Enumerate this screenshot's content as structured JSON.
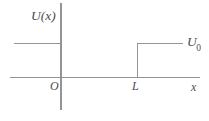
{
  "figure": {
    "background_color": "#ffffff",
    "line_color": "#949494",
    "text_color": "#4d4d4d"
  },
  "axes": {
    "vertical_label": "U(x)",
    "horizontal_label": "x",
    "origin_label": "O"
  },
  "markers": {
    "step_position_label": "L",
    "step_height_label": "U",
    "step_height_subscript": "0"
  },
  "chart_data": {
    "type": "line",
    "title": "",
    "xlabel": "x",
    "ylabel": "U(x)",
    "grid": false,
    "legend": false,
    "xlim": [
      -1.0,
      3.0
    ],
    "ylim": [
      0,
      1.4
    ],
    "annotations": [
      "O",
      "L",
      "U_0"
    ],
    "series": [
      {
        "name": "U(x)",
        "comment": "Piecewise potential: constant U0 for x<0, zero for 0<x<L, constant U0 for x>L",
        "x": [
          -1.0,
          0.0,
          0.0,
          2.0,
          2.0,
          3.0
        ],
        "y": [
          1.0,
          1.0,
          0.0,
          0.0,
          1.0,
          1.0
        ]
      }
    ],
    "reference_values": {
      "U_0": 1.0,
      "L": 2.0,
      "well_floor": 0.0
    }
  }
}
